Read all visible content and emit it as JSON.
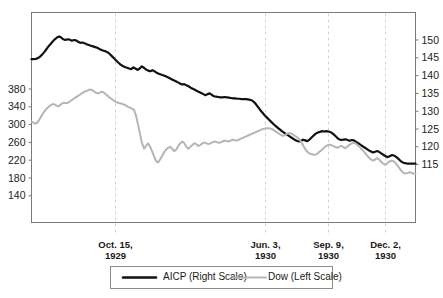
{
  "chart_data": {
    "type": "line",
    "title": "",
    "xlabel": "",
    "ylabel": "",
    "grid": "vertical-dashed-at-event-dates",
    "legend_position": "bottom-center",
    "left_axis": {
      "name": "Dow (Left Scale)",
      "ticks": [
        380,
        340,
        300,
        260,
        220,
        180,
        140
      ],
      "tick_labels": [
        "380",
        "340",
        "300",
        "260",
        "220",
        "180",
        "140"
      ],
      "ylim": [
        120,
        420
      ]
    },
    "right_axis": {
      "name": "AICP (Right Scale)",
      "ticks": [
        150,
        145,
        140,
        135,
        130,
        125,
        120,
        115
      ],
      "tick_labels": [
        "150",
        "145",
        "140",
        "135",
        "130",
        "125",
        "120",
        "115"
      ],
      "ylim": [
        112.5,
        153.0
      ]
    },
    "x_event_labels": [
      {
        "line1": "Oct. 15,",
        "line2": "1929",
        "x_frac": 0.2188
      },
      {
        "line1": "Jun. 3,",
        "line2": "1930",
        "x_frac": 0.6094
      },
      {
        "line1": "Sep. 9,",
        "line2": "1930",
        "x_frac": 0.7734
      },
      {
        "line1": "Dec. 2,",
        "line2": "1930",
        "x_frac": 0.9219
      }
    ],
    "series": [
      {
        "name": "AICP (Right Scale)",
        "legend_label": "AICP (Right Scale)",
        "axis": "right",
        "color": "#111111",
        "width": 2.2,
        "values": [
          144.6,
          144.6,
          144.7,
          144.9,
          145.3,
          145.9,
          146.6,
          147.4,
          148.2,
          148.9,
          149.6,
          150.2,
          150.7,
          151.0,
          150.7,
          150.2,
          150.0,
          150.2,
          150.1,
          149.8,
          150.0,
          149.9,
          149.5,
          149.2,
          149.3,
          149.1,
          148.8,
          148.6,
          148.4,
          148.2,
          148.0,
          147.8,
          147.5,
          147.2,
          147.0,
          146.8,
          146.5,
          146.0,
          145.4,
          144.8,
          144.2,
          143.6,
          143.1,
          142.7,
          142.4,
          142.2,
          142.0,
          141.8,
          142.3,
          142.0,
          141.6,
          142.0,
          142.6,
          142.2,
          141.7,
          141.4,
          141.2,
          141.5,
          141.2,
          140.8,
          140.5,
          140.3,
          140.1,
          139.9,
          139.6,
          139.3,
          139.0,
          138.7,
          138.4,
          138.1,
          137.8,
          137.5,
          137.6,
          137.3,
          137.0,
          136.6,
          136.3,
          136.0,
          135.7,
          135.4,
          135.1,
          134.8,
          134.5,
          134.8,
          135.0,
          134.6,
          134.2,
          134.1,
          134.0,
          133.9,
          133.9,
          134.0,
          133.9,
          133.8,
          133.7,
          133.6,
          133.6,
          133.5,
          133.5,
          133.4,
          133.4,
          133.4,
          133.3,
          133.2,
          133.0,
          132.5,
          131.8,
          131.0,
          130.2,
          129.5,
          128.8,
          128.2,
          127.6,
          127.0,
          126.4,
          125.9,
          125.4,
          124.9,
          124.4,
          124.0,
          123.6,
          123.2,
          122.8,
          122.4,
          122.0,
          121.7,
          121.5,
          121.7,
          122.0,
          121.8,
          121.6,
          122.0,
          122.6,
          123.2,
          123.7,
          124.0,
          124.2,
          124.4,
          124.3,
          124.4,
          124.3,
          124.1,
          123.7,
          123.2,
          122.6,
          122.1,
          121.9,
          122.0,
          122.1,
          121.9,
          121.7,
          121.9,
          121.8,
          121.4,
          121.0,
          120.6,
          120.2,
          119.8,
          119.4,
          119.0,
          118.7,
          118.4,
          118.6,
          118.8,
          118.5,
          118.1,
          117.7,
          117.3,
          117.1,
          117.4,
          117.7,
          117.5,
          117.1,
          116.6,
          116.0,
          115.6,
          115.4,
          115.3,
          115.3,
          115.3,
          115.3,
          115.3
        ]
      },
      {
        "name": "Dow (Left Scale)",
        "legend_label": "Dow (Left Scale)",
        "axis": "left",
        "color": "#b5b5b5",
        "width": 2.0,
        "values": [
          307,
          304,
          302,
          305,
          312,
          320,
          327,
          333,
          338,
          342,
          345,
          346,
          344,
          341,
          343,
          347,
          349,
          348,
          349,
          352,
          355,
          358,
          361,
          364,
          367,
          370,
          373,
          375,
          377,
          379,
          378,
          375,
          372,
          370,
          372,
          374,
          372,
          368,
          364,
          360,
          357,
          354,
          351,
          349,
          348,
          347,
          345,
          343,
          340,
          338,
          336,
          333,
          320,
          300,
          278,
          258,
          246,
          252,
          258,
          250,
          240,
          228,
          218,
          215,
          222,
          230,
          238,
          244,
          248,
          250,
          246,
          240,
          244,
          252,
          258,
          262,
          258,
          250,
          246,
          250,
          254,
          258,
          256,
          252,
          254,
          258,
          260,
          258,
          256,
          258,
          260,
          262,
          261,
          259,
          260,
          262,
          264,
          263,
          262,
          264,
          266,
          265,
          264,
          266,
          268,
          270,
          272,
          274,
          276,
          278,
          280,
          282,
          284,
          286,
          288,
          290,
          291,
          292,
          292,
          291,
          289,
          286,
          283,
          280,
          277,
          275,
          276,
          279,
          281,
          280,
          278,
          275,
          272,
          268,
          262,
          254,
          246,
          240,
          236,
          234,
          233,
          232,
          234,
          238,
          242,
          246,
          250,
          253,
          255,
          254,
          252,
          250,
          248,
          250,
          252,
          250,
          247,
          250,
          254,
          257,
          259,
          258,
          255,
          251,
          246,
          241,
          236,
          230,
          225,
          221,
          219,
          222,
          225,
          221,
          216,
          212,
          210,
          213,
          217,
          219,
          218,
          214,
          208,
          202,
          196,
          192,
          190,
          191,
          193,
          192,
          190,
          190
        ]
      }
    ]
  },
  "legend": {
    "items": [
      {
        "label": "AICP (Right Scale)",
        "color": "#111111"
      },
      {
        "label": "Dow (Left Scale)",
        "color": "#b5b5b5"
      }
    ]
  }
}
